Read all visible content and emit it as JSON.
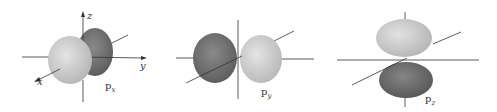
{
  "figure": {
    "colors": {
      "light_lobe": "#cfcfcf",
      "dark_lobe": "#6e6e6e",
      "axis": "#333333",
      "background": "#ffffff"
    },
    "panels": [
      {
        "id": "px",
        "label_main": "p",
        "label_sub": "x",
        "axes": {
          "z": "z",
          "y": "y",
          "x": "x"
        }
      },
      {
        "id": "py",
        "label_main": "p",
        "label_sub": "y"
      },
      {
        "id": "pz",
        "label_main": "p",
        "label_sub": "z"
      }
    ]
  }
}
